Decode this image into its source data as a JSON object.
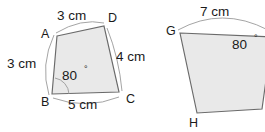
{
  "figure": {
    "kind": "geometry-quadrilaterals",
    "background_color": "#ffffff",
    "shape_fill_color": "#e9e9e9",
    "shape_stroke_color": "#6a6a6a",
    "arc_color": "#9a9a9a",
    "text_color": "#1a1a1a"
  },
  "left_shape": {
    "name": "quadrilateral-abcd",
    "vertices": [
      {
        "label": "A",
        "x": 57,
        "y": 36
      },
      {
        "label": "D",
        "x": 104,
        "y": 26
      },
      {
        "label": "C",
        "x": 119,
        "y": 92
      },
      {
        "label": "B",
        "x": 52,
        "y": 94
      }
    ],
    "vertex_labels": [
      {
        "label": "A",
        "x": 41,
        "y": 35
      },
      {
        "label": "D",
        "x": 108,
        "y": 19
      },
      {
        "label": "C",
        "x": 126,
        "y": 100
      },
      {
        "label": "B",
        "x": 41,
        "y": 103
      }
    ],
    "side_labels": [
      {
        "text": "3 cm",
        "x": 57,
        "y": 16,
        "side": "AD"
      },
      {
        "text": "4 cm",
        "x": 116,
        "y": 57,
        "side": "DC"
      },
      {
        "text": "5 cm",
        "x": 68,
        "y": 105,
        "side": "BC"
      },
      {
        "text": "3 cm",
        "x": 7,
        "y": 64,
        "side": "AB"
      }
    ],
    "angle": {
      "value": "80",
      "degree_symbol": "°",
      "at_vertex": "B",
      "x": 62,
      "y": 76
    }
  },
  "right_shape": {
    "name": "quadrilateral-gh",
    "vertices": [
      {
        "label": "G",
        "x": 180,
        "y": 33
      },
      {
        "label": "top-right",
        "x": 272,
        "y": 37
      },
      {
        "label": "bottom-right",
        "x": 262,
        "y": 109
      },
      {
        "label": "H",
        "x": 197,
        "y": 113
      }
    ],
    "vertex_labels": [
      {
        "label": "G",
        "x": 166,
        "y": 32
      },
      {
        "label": "H",
        "x": 189,
        "y": 124
      }
    ],
    "side_labels": [
      {
        "text": "7 cm",
        "x": 200,
        "y": 12,
        "side": "top"
      }
    ],
    "angle": {
      "value": "80",
      "degree_symbol": "°",
      "x": 232,
      "y": 45
    }
  }
}
